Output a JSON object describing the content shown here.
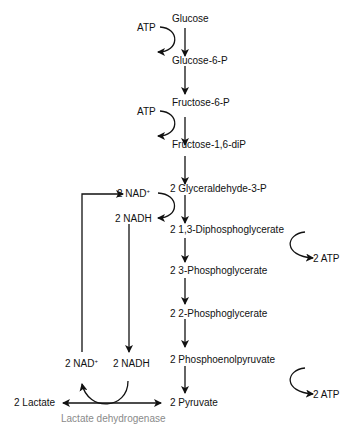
{
  "diagram": {
    "main_pathway": [
      {
        "id": "glucose",
        "label": "Glucose"
      },
      {
        "id": "glucose-6-p",
        "label": "Glucose-6-P"
      },
      {
        "id": "fructose-6-p",
        "label": "Fructose-6-P"
      },
      {
        "id": "fructose-1-6-dip",
        "label": "Fructose-1,6-diP"
      },
      {
        "id": "glyceraldehyde-3-p",
        "label": "2 Glyceraldehyde-3-P"
      },
      {
        "id": "diphosphoglycerate",
        "label": "2 1,3-Diphosphoglycerate"
      },
      {
        "id": "3-phosphoglycerate",
        "label": "2 3-Phosphoglycerate"
      },
      {
        "id": "2-phosphoglycerate",
        "label": "2 2-Phosphoglycerate"
      },
      {
        "id": "phosphoenolpyruvate",
        "label": "2 Phosphoenolpyruvate"
      },
      {
        "id": "pyruvate",
        "label": "2 Pyruvate"
      }
    ],
    "side_inputs": {
      "atp_in_1": "ATP",
      "atp_in_2": "ATP",
      "nad_plus_top": "2 NAD",
      "nad_plus_top_sup": "+",
      "nadh_top": "2 NADH",
      "atp_out_1": "2 ATP",
      "atp_out_2": "2 ATP",
      "nad_plus_bottom": "2 NAD",
      "nad_plus_bottom_sup": "+",
      "nadh_bottom": "2 NADH"
    },
    "fermentation": {
      "product": "2 Lactate",
      "enzyme": "Lactate dehydrogenase"
    },
    "colors": {
      "arrow": "#111111",
      "text": "#111111",
      "enzyme_text": "#8a8a8a"
    }
  }
}
